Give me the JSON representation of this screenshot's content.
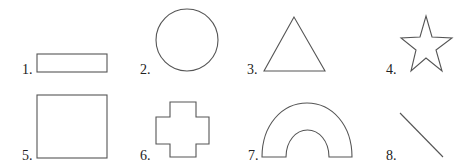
{
  "figure": {
    "items": [
      {
        "number": "1.",
        "shape": "rectangle"
      },
      {
        "number": "2.",
        "shape": "circle"
      },
      {
        "number": "3.",
        "shape": "triangle"
      },
      {
        "number": "4.",
        "shape": "star"
      },
      {
        "number": "5.",
        "shape": "square"
      },
      {
        "number": "6.",
        "shape": "cross"
      },
      {
        "number": "7.",
        "shape": "arch"
      },
      {
        "number": "8.",
        "shape": "line"
      }
    ],
    "colors": {
      "stroke": "#555555",
      "text": "#222222",
      "background": "#ffffff"
    }
  }
}
